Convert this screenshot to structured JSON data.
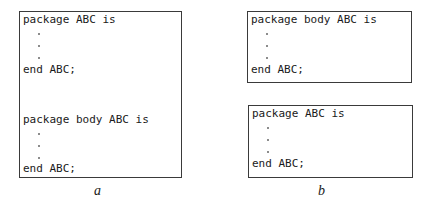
{
  "panels": {
    "a": {
      "caption": "a",
      "block1": {
        "first_line": "package ABC is",
        "last_line": "end ABC;"
      },
      "block2": {
        "first_line": "package body ABC is",
        "last_line": "end ABC;"
      }
    },
    "b": {
      "caption": "b",
      "block1": {
        "first_line": "package body ABC is",
        "last_line": "end ABC;"
      },
      "block2": {
        "first_line": "package ABC is",
        "last_line": "end ABC;"
      }
    }
  }
}
